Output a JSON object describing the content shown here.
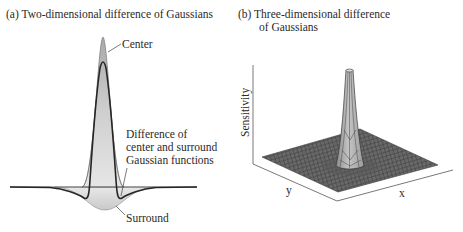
{
  "panel_a": {
    "title": "(a)  Two-dimensional difference of Gaussians",
    "labels": {
      "center": "Center",
      "difference_line1": "Difference of",
      "difference_line2": "center and surround",
      "difference_line3": "Gaussian functions",
      "surround": "Surround"
    }
  },
  "panel_b": {
    "title_line1": "(b)  Three-dimensional difference",
    "title_line2": "of Gaussians",
    "axes": {
      "z_label": "Sensitivity",
      "y_label": "y",
      "x_label": "x"
    }
  },
  "colors": {
    "ink": "#2a2a2a",
    "curve_dark": "#2b2b2b",
    "fill_gray": "#c8c8c8",
    "fill_light": "#e2e2e2",
    "mesh_dark": "#4a4a4a",
    "peak_gray": "#a8a8a8"
  }
}
